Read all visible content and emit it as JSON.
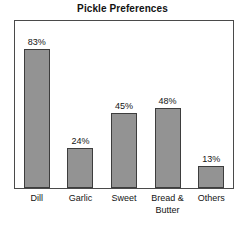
{
  "chart_data": {
    "type": "bar",
    "title": "Pickle Preferences",
    "xlabel": "",
    "ylabel": "",
    "ylim": [
      0,
      100
    ],
    "grid": false,
    "legend": false,
    "value_suffix": "%",
    "categories": [
      "Dill",
      "Garlic",
      "Sweet",
      "Bread & Butter",
      "Others"
    ],
    "values": [
      83,
      24,
      45,
      48,
      13
    ],
    "value_labels": [
      "83%",
      "24%",
      "45%",
      "48%",
      "13%"
    ],
    "category_lines": [
      [
        "Dill"
      ],
      [
        "Garlic"
      ],
      [
        "Sweet"
      ],
      [
        "Bread &",
        "Butter"
      ],
      [
        "Others"
      ]
    ],
    "colors": {
      "bar_fill": "#939393",
      "bar_stroke": "#3d3d3d",
      "frame": "#4a4a4a",
      "text": "#141414",
      "background": "#ffffff"
    }
  }
}
